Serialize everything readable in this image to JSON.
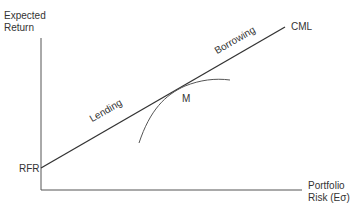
{
  "diagram": {
    "y_axis_label_line1": "Expected",
    "y_axis_label_line2": "Return",
    "x_axis_label_line1": "Portfolio",
    "x_axis_label_line2": "Risk (Eσ)",
    "intercept_label": "RFR",
    "line_label": "CML",
    "tangent_point_label": "M",
    "left_segment_label": "Lending",
    "right_segment_label": "Borrowing",
    "line_color": "#333333",
    "curve_color": "#555555"
  }
}
